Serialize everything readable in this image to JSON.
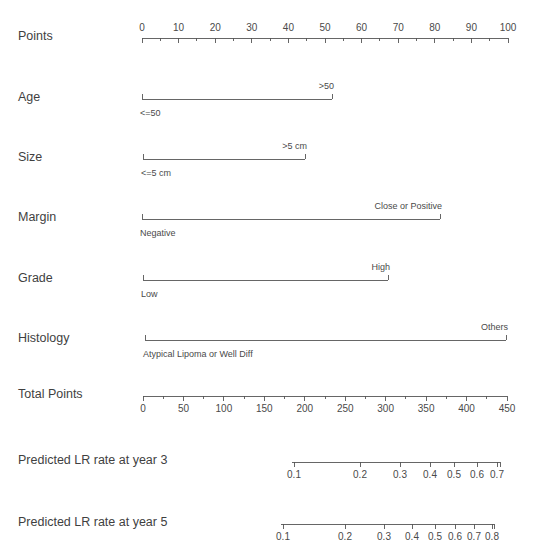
{
  "figure": {
    "type": "nomogram",
    "background": "#ffffff",
    "line_color": "#555555",
    "text_color": "#3f3f3f",
    "width": 537,
    "height": 557
  },
  "chart_data": {
    "type": "line",
    "title": "",
    "subtitle": "",
    "xlabel": "",
    "ylabel": "",
    "grid": false,
    "legend": "none",
    "rows": [
      {
        "name": "points",
        "label": "Points",
        "kind": "numeric-scale",
        "axis_y": 38,
        "x_start": 142,
        "x_end": 508,
        "labels_position": "above",
        "ticks_position": "below",
        "range": [
          0,
          100
        ],
        "major_step": 10,
        "minor_step": 5,
        "tick_labels": [
          "0",
          "10",
          "20",
          "30",
          "40",
          "50",
          "60",
          "70",
          "80",
          "90",
          "100"
        ],
        "tick_values": [
          0,
          10,
          20,
          30,
          40,
          50,
          60,
          70,
          80,
          90,
          100
        ]
      },
      {
        "name": "age",
        "label": "Age",
        "kind": "binary-predictor",
        "axis_y": 99,
        "x_start": 142,
        "x_end": 332,
        "levels": [
          {
            "label": "<=50",
            "position": "below-left",
            "points": 0
          },
          {
            "label": ">50",
            "position": "above-right",
            "points": 52
          }
        ]
      },
      {
        "name": "size",
        "label": "Size",
        "kind": "binary-predictor",
        "axis_y": 159,
        "x_start": 143,
        "x_end": 305,
        "levels": [
          {
            "label": "<=5 cm",
            "position": "below-left",
            "points": 0
          },
          {
            "label": ">5 cm",
            "position": "above-right",
            "points": 44
          }
        ]
      },
      {
        "name": "margin",
        "label": "Margin",
        "kind": "binary-predictor",
        "axis_y": 219,
        "x_start": 142,
        "x_end": 440,
        "levels": [
          {
            "label": "Negative",
            "position": "below-left",
            "points": 0
          },
          {
            "label": "Close or Positive",
            "position": "above-right",
            "points": 81
          }
        ]
      },
      {
        "name": "grade",
        "label": "Grade",
        "kind": "binary-predictor",
        "axis_y": 280,
        "x_start": 143,
        "x_end": 388,
        "levels": [
          {
            "label": "Low",
            "position": "below-left",
            "points": 0
          },
          {
            "label": "High",
            "position": "above-right",
            "points": 67
          }
        ]
      },
      {
        "name": "histology",
        "label": "Histology",
        "kind": "binary-predictor",
        "axis_y": 340,
        "x_start": 145,
        "x_end": 506,
        "levels": [
          {
            "label": "Atypical Lipoma or Well Diff",
            "position": "below-left",
            "points": 0
          },
          {
            "label": "Others",
            "position": "above-right",
            "points": 99
          }
        ]
      },
      {
        "name": "total-points",
        "label": "Total Points",
        "kind": "numeric-scale",
        "axis_y": 396,
        "x_start": 143,
        "x_end": 507,
        "labels_position": "below",
        "ticks_position": "below",
        "range": [
          0,
          450
        ],
        "major_step": 50,
        "minor_step": 25,
        "tick_labels": [
          "0",
          "50",
          "100",
          "150",
          "200",
          "250",
          "300",
          "350",
          "400",
          "450"
        ],
        "tick_values": [
          0,
          50,
          100,
          150,
          200,
          250,
          300,
          350,
          400,
          450
        ]
      },
      {
        "name": "lr-year-3",
        "label": "Predicted LR rate at year 3",
        "kind": "probability-scale",
        "axis_y": 462,
        "x_start": 292,
        "x_end": 500,
        "labels_position": "below",
        "ticks_position": "below",
        "tick_labels": [
          "0.1",
          "0.2",
          "0.3",
          "0.4",
          "0.5",
          "0.6",
          "0.7"
        ],
        "tick_values": [
          0.1,
          0.2,
          0.3,
          0.4,
          0.5,
          0.6,
          0.7
        ],
        "tick_x": [
          294,
          360,
          400,
          430,
          454,
          477,
          497
        ]
      },
      {
        "name": "lr-year-5",
        "label": "Predicted LR rate at year 5",
        "kind": "probability-scale",
        "axis_y": 524,
        "x_start": 281,
        "x_end": 494,
        "labels_position": "below",
        "ticks_position": "below",
        "tick_labels": [
          "0.1",
          "0.2",
          "0.3",
          "0.4",
          "0.5",
          "0.6",
          "0.7",
          "0.8"
        ],
        "tick_values": [
          0.1,
          0.2,
          0.3,
          0.4,
          0.5,
          0.6,
          0.7,
          0.8
        ],
        "tick_x": [
          283,
          345,
          384,
          412,
          435,
          455,
          474,
          492
        ]
      }
    ]
  }
}
